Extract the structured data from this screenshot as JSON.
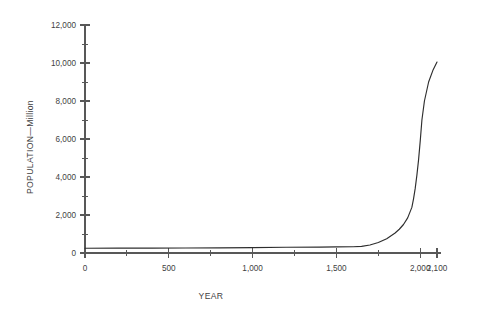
{
  "chart_data": {
    "type": "line",
    "title": "",
    "subtitle": "",
    "xlabel": "YEAR",
    "ylabel": "POPULATION—Million",
    "xlim": [
      0,
      2100
    ],
    "ylim": [
      0,
      12000
    ],
    "grid": false,
    "legend": null,
    "x_tick_labels": [
      "0",
      "500",
      "1,000",
      "1,500",
      "2,000",
      "2,100"
    ],
    "x_tick_values": [
      0,
      500,
      1000,
      1500,
      2000,
      2100
    ],
    "x_minor_tick_values": [
      250,
      750,
      1250,
      1750
    ],
    "y_tick_labels": [
      "0",
      "2,000",
      "4,000",
      "6,000",
      "8,000",
      "10,000",
      "12,000"
    ],
    "y_tick_values": [
      0,
      2000,
      4000,
      6000,
      8000,
      10000,
      12000
    ],
    "y_minor_tick_values": [
      1000,
      3000,
      5000,
      7000,
      9000,
      11000
    ],
    "series": [
      {
        "name": "World population",
        "x": [
          0,
          200,
          400,
          600,
          800,
          1000,
          1200,
          1400,
          1500,
          1600,
          1650,
          1700,
          1750,
          1800,
          1850,
          1875,
          1900,
          1925,
          1950,
          1960,
          1970,
          1980,
          1990,
          2000,
          2010,
          2025,
          2050,
          2075,
          2100
        ],
        "values": [
          250,
          255,
          260,
          265,
          270,
          280,
          300,
          310,
          320,
          330,
          350,
          420,
          550,
          750,
          1050,
          1250,
          1500,
          1850,
          2400,
          2850,
          3400,
          4100,
          4900,
          5900,
          7000,
          8000,
          9000,
          9600,
          10050
        ]
      }
    ],
    "annotations": []
  },
  "style": {
    "background_color": "#ffffff",
    "curve_color": "#2e2e2e",
    "axis_color": "#585858",
    "text_color": "#3f3f3f"
  }
}
